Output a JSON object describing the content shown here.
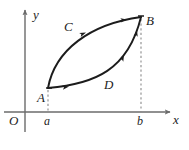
{
  "figure": {
    "background_color": "#ffffff",
    "stroke_color": "#1c1c1c",
    "axis_color": "#6b6b6b",
    "dash_color": "#8a8a8a"
  },
  "axes": {
    "x_label": "x",
    "y_label": "y",
    "origin_label": "O",
    "x_axis_y_px": 112,
    "y_axis_x_px": 25,
    "x_axis_end_px": 172,
    "y_axis_top_px": 8
  },
  "ticks": [
    {
      "name": "a",
      "label": "a",
      "x_px": 48
    },
    {
      "name": "b",
      "label": "b",
      "x_px": 141
    }
  ],
  "points": [
    {
      "name": "A",
      "label": "A",
      "x_px": 48,
      "y_px": 88
    },
    {
      "name": "B",
      "label": "B",
      "x_px": 141,
      "y_px": 17
    }
  ],
  "curves": [
    {
      "name": "upper-curve",
      "label": "C",
      "description": "upper arc from A to B, concave down, traversed from A toward B",
      "label_x_px": 67,
      "label_y_px": 20,
      "path": "M 48 88 C 55 50 90 24 141 17",
      "arrow_t": 0.42
    },
    {
      "name": "lower-curve",
      "label": "D",
      "description": "lower arc from A to B, concave up, traversed from A toward B",
      "label_x_px": 104,
      "label_y_px": 78,
      "path": "M 48 88 C 95 84 128 70 141 17",
      "arrow_t": 0.62
    }
  ],
  "dashed_lines": [
    {
      "name": "dash-at-a",
      "x_px": 48,
      "from_y_px": 88,
      "to_y_px": 112
    },
    {
      "name": "dash-at-b",
      "x_px": 141,
      "from_y_px": 17,
      "to_y_px": 112
    }
  ],
  "arrow_marks": [
    {
      "name": "arrow-on-C-near-A",
      "x_px": 66,
      "y_px": 86,
      "angle_deg": -12
    },
    {
      "name": "arrow-on-C-mid",
      "x_px": 85,
      "y_px": 33,
      "angle_deg": -25
    },
    {
      "name": "arrow-on-C-near-B",
      "x_px": 125,
      "y_px": 20,
      "angle_deg": -8
    },
    {
      "name": "arrow-on-D-mid",
      "x_px": 122,
      "y_px": 58,
      "angle_deg": -66
    },
    {
      "name": "arrow-on-D-near-B",
      "x_px": 135,
      "y_px": 32,
      "angle_deg": -76
    }
  ]
}
